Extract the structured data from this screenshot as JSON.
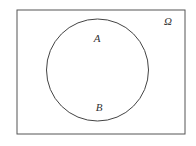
{
  "diagram": {
    "type": "venn",
    "universe": {
      "label": "Ω",
      "x": 17,
      "y": 10,
      "width": 168,
      "height": 124,
      "stroke": "#555555"
    },
    "sets": [
      {
        "name": "A=B",
        "cx": 97.5,
        "cy": 70,
        "r": 51,
        "stroke": "#444444"
      }
    ],
    "labels": [
      {
        "id": "A",
        "text": "A",
        "x": 97,
        "y": 42
      },
      {
        "id": "B",
        "text": "B",
        "x": 99,
        "y": 111
      },
      {
        "id": "omega",
        "text": "Ω",
        "x": 168,
        "y": 25
      }
    ]
  }
}
